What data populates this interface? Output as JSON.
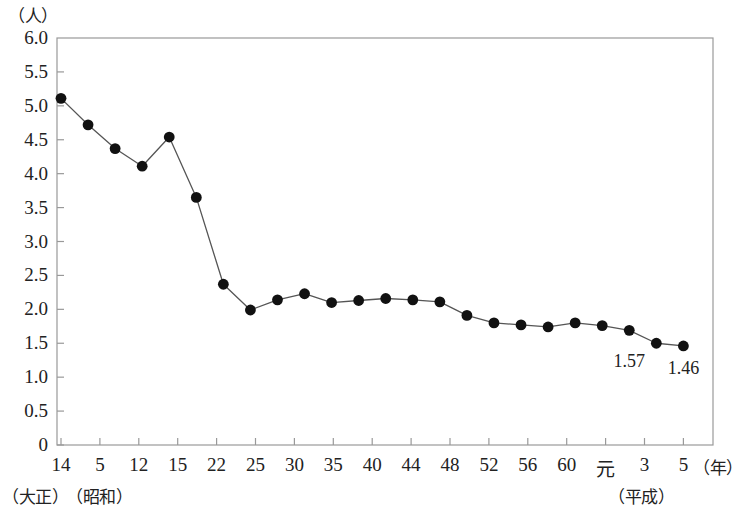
{
  "chart_data": {
    "type": "line",
    "title": "",
    "xlabel": "年",
    "ylabel": "人",
    "y_unit_label": "（人）",
    "x_unit_label": "（年）",
    "ylim": [
      0,
      6.0
    ],
    "grid": false,
    "legend": null,
    "y_ticks": [
      "6.0",
      "5.5",
      "5.0",
      "4.5",
      "4.0",
      "3.5",
      "3.0",
      "2.5",
      "2.0",
      "1.5",
      "1.0",
      "0.5",
      "0"
    ],
    "y_tick_values": [
      6.0,
      5.5,
      5.0,
      4.5,
      4.0,
      3.5,
      3.0,
      2.5,
      2.0,
      1.5,
      1.0,
      0.5,
      0
    ],
    "x_tick_labels": [
      "14",
      "5",
      "12",
      "15",
      "22",
      "25",
      "30",
      "35",
      "40",
      "44",
      "48",
      "52",
      "56",
      "60",
      "元",
      "3",
      "5"
    ],
    "era_labels": [
      {
        "text": "（大正）",
        "after_tick": "14"
      },
      {
        "text": "（昭和）",
        "after_tick": "5"
      },
      {
        "text": "（平成）",
        "after_tick": "元"
      }
    ],
    "categories": [
      "14",
      "5",
      "12",
      "15",
      "22",
      "25",
      "30",
      "35",
      "40",
      "42",
      "43",
      "44",
      "46",
      "47",
      "48",
      "50",
      "52",
      "54",
      "56",
      "58",
      "60",
      "62",
      "3",
      "5"
    ],
    "values": [
      5.11,
      4.72,
      4.37,
      4.11,
      4.54,
      3.65,
      2.37,
      1.99,
      2.14,
      2.23,
      2.1,
      2.13,
      2.16,
      2.14,
      2.11,
      1.91,
      1.8,
      1.77,
      1.74,
      1.8,
      1.76,
      1.69,
      1.5,
      1.46
    ],
    "annotations": [
      {
        "label": "1.57",
        "value": 1.57,
        "index": 21
      },
      {
        "label": "1.46",
        "value": 1.46,
        "index": 23
      }
    ],
    "series_color": "#555555",
    "marker_color": "#111111",
    "axis_color": "#999999"
  }
}
